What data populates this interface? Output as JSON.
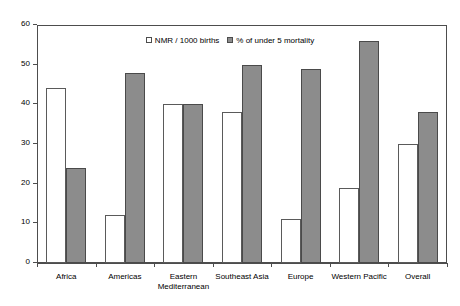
{
  "chart_data": {
    "type": "bar",
    "title": "",
    "subtitle": "",
    "xlabel": "",
    "ylabel": "",
    "ylim": [
      0,
      60
    ],
    "ytick_step": 10,
    "yticks": [
      0,
      10,
      20,
      30,
      40,
      50,
      60
    ],
    "grid": false,
    "legend_position": "top-center",
    "categories": [
      "Africa",
      "Americas",
      "Eastern Mediterranean",
      "Southeast Asia",
      "Europe",
      "Western Pacific",
      "Overall"
    ],
    "category_lines": [
      [
        "Africa"
      ],
      [
        "Americas"
      ],
      [
        "Eastern",
        "Mediterranean"
      ],
      [
        "Southeast Asia"
      ],
      [
        "Europe"
      ],
      [
        "Western Pacific"
      ],
      [
        "Overall"
      ]
    ],
    "series": [
      {
        "name": "NMR / 1000 births",
        "color": "#ffffff",
        "edge_color": "#5a5a5a",
        "values": [
          44,
          12,
          40,
          38,
          11,
          19,
          30
        ]
      },
      {
        "name": "% of under 5 mortality",
        "color": "#8c8c8c",
        "edge_color": "#4a4a4a",
        "values": [
          24,
          48,
          40,
          50,
          49,
          56,
          38
        ]
      }
    ]
  },
  "legend": {
    "items": [
      {
        "label": "NMR / 1000 births",
        "swatch": "hollow-square-swatch"
      },
      {
        "label": "% of under 5 mortality",
        "swatch": "filled-square-swatch"
      }
    ]
  },
  "axis": {
    "y_tick_labels": [
      "60",
      "50",
      "40",
      "30",
      "20",
      "10",
      "0"
    ]
  }
}
